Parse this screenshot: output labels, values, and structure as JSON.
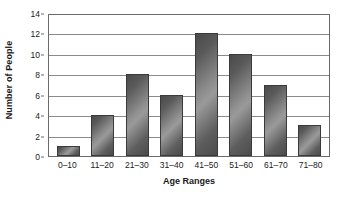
{
  "chart_data": {
    "type": "bar",
    "title": "",
    "xlabel": "Age Ranges",
    "ylabel": "Number of People",
    "categories": [
      "0–10",
      "11–20",
      "21–30",
      "31–40",
      "41–50",
      "51–60",
      "61–70",
      "71–80"
    ],
    "values": [
      1,
      4,
      8,
      6,
      12,
      10,
      7,
      3
    ],
    "ylim": [
      0,
      14
    ],
    "ytick_labels": [
      "14",
      "12",
      "10",
      "8",
      "6",
      "4",
      "2",
      "0"
    ],
    "ytick_values": [
      14,
      12,
      10,
      8,
      6,
      4,
      2,
      0
    ],
    "ytick_step": 2,
    "grid": "horizontal",
    "legend": "none",
    "bar_color_dark": "#4a4a4a",
    "bar_color_light": "#9a9a9a",
    "bar_border_color": "#3a3a3a",
    "gridline_color": "#8a8a8a",
    "frame_color": "#6b6b6b",
    "background_color": "#ffffff"
  }
}
